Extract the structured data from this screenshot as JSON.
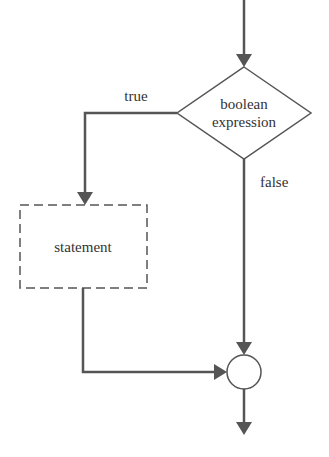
{
  "diagram": {
    "condition": {
      "line1": "boolean",
      "line2": "expression"
    },
    "branches": {
      "true_label": "true",
      "false_label": "false"
    },
    "statement": {
      "label": "statement"
    },
    "colors": {
      "line": "#555555",
      "text": "#333333",
      "background": "#ffffff"
    }
  }
}
